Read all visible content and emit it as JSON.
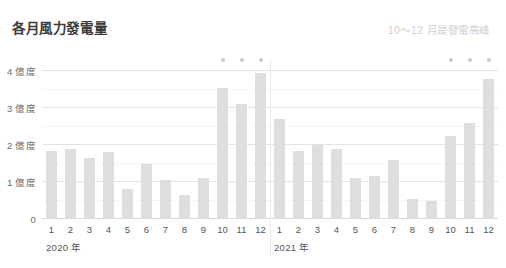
{
  "header": {
    "title": "各月風力發電量",
    "note": "10～12 月是發電高峰"
  },
  "axis": {
    "y_labels": [
      "4 億度",
      "3 億度",
      "2 億度",
      "1 億度",
      "0"
    ],
    "y_values": [
      4,
      3,
      2,
      1,
      0
    ]
  },
  "colors": {
    "bar": "#dedede",
    "dot": "#c9c9c9",
    "grid": "#ececec",
    "title": "#3b3b3b",
    "note": "#cfcfcf",
    "tick": "#555555",
    "background": "#ffffff"
  },
  "chart_data": {
    "type": "bar",
    "title": "各月風力發電量",
    "annotation": "10～12 月是發電高峰",
    "xlabel": "",
    "ylabel": "億度",
    "ylim": [
      0,
      4.3
    ],
    "yticks": [
      0,
      1,
      2,
      3,
      4
    ],
    "ytick_labels": [
      "0",
      "1 億度",
      "2 億度",
      "3 億度",
      "4 億度"
    ],
    "grid": true,
    "legend": false,
    "categories": [
      "1",
      "2",
      "3",
      "4",
      "5",
      "6",
      "7",
      "8",
      "9",
      "10",
      "11",
      "12"
    ],
    "groups": [
      {
        "name": "2020 年",
        "label": "2020 年",
        "months": [
          "1",
          "2",
          "3",
          "4",
          "5",
          "6",
          "7",
          "8",
          "9",
          "10",
          "11",
          "12"
        ],
        "values": [
          1.85,
          1.9,
          1.65,
          1.8,
          0.8,
          1.5,
          1.05,
          0.65,
          1.1,
          3.55,
          3.1,
          3.95
        ],
        "highlighted_months": [
          "10",
          "11",
          "12"
        ]
      },
      {
        "name": "2021 年",
        "label": "2021 年",
        "months": [
          "1",
          "2",
          "3",
          "4",
          "5",
          "6",
          "7",
          "8",
          "9",
          "10",
          "11",
          "12"
        ],
        "values": [
          2.7,
          1.85,
          2.0,
          1.9,
          1.1,
          1.15,
          1.6,
          0.55,
          0.5,
          2.25,
          2.6,
          3.8
        ],
        "highlighted_months": [
          "10",
          "11",
          "12"
        ]
      }
    ]
  }
}
